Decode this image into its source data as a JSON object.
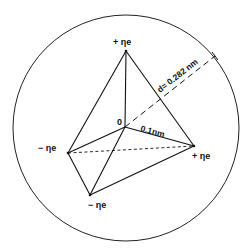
{
  "diagram": {
    "type": "tetrahedral charge model",
    "center_label": "0",
    "vertices": [
      {
        "id": "top",
        "label": "+ ηe",
        "charge": "+"
      },
      {
        "id": "left",
        "label": "− ηe",
        "charge": "−"
      },
      {
        "id": "right",
        "label": "+ ηe",
        "charge": "+"
      },
      {
        "id": "bottom",
        "label": "− ηe",
        "charge": "−"
      }
    ],
    "bond_length_label": "0.1nm",
    "diameter_label": "d= 0.282 nm",
    "line_color": "#111111",
    "background": "#ffffff"
  }
}
